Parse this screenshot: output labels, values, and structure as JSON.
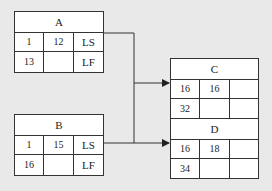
{
  "nodes": {
    "A": {
      "title": "A",
      "r1": [
        "1",
        "12",
        "LS"
      ],
      "r2": [
        "13",
        "",
        "LF"
      ]
    },
    "B": {
      "title": "B",
      "r1": [
        "1",
        "15",
        "LS"
      ],
      "r2": [
        "16",
        "",
        "LF"
      ]
    },
    "C": {
      "title": "C",
      "r1": [
        "16",
        "16",
        ""
      ],
      "r2": [
        "32",
        "",
        ""
      ]
    },
    "D": {
      "title": "D",
      "r1": [
        "16",
        "18",
        ""
      ],
      "r2": [
        "34",
        "",
        ""
      ]
    }
  },
  "edges": [
    {
      "from": "A",
      "to": "C"
    },
    {
      "from": "A",
      "to": "D"
    },
    {
      "from": "B",
      "to": "C"
    },
    {
      "from": "B",
      "to": "D"
    }
  ]
}
